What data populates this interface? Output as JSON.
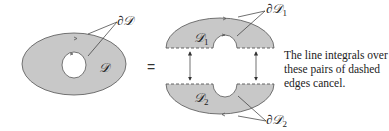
{
  "diagram": {
    "left_region": {
      "label": "𝒟",
      "boundary_label": "∂𝒟"
    },
    "equals_sign": "=",
    "upper_region": {
      "label": "𝒟",
      "subscript": "1",
      "boundary_label": "∂𝒟",
      "boundary_subscript": "1"
    },
    "lower_region": {
      "label": "𝒟",
      "subscript": "2",
      "boundary_label": "∂𝒟",
      "boundary_subscript": "2"
    },
    "note": "The line integrals over these pairs of dashed edges cancel.",
    "colors": {
      "fill": "#c8c8c8",
      "stroke": "#555555",
      "line": "#333333"
    }
  }
}
